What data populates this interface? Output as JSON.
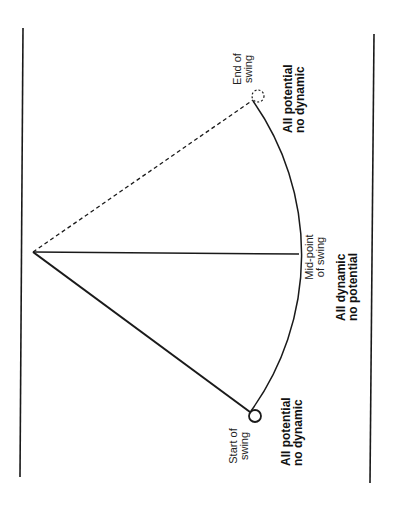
{
  "diagram": {
    "orientation": "rotated -90deg",
    "colors": {
      "background": "#ffffff",
      "ink": "#1a1a1a"
    },
    "geometry": {
      "pivot": [
        33,
        252
      ],
      "mid_point": [
        299,
        254
      ],
      "start_bob": [
        255,
        416
      ],
      "end_bob": [
        258,
        96
      ],
      "bob_radius": 6,
      "left_rule": {
        "x1": 23,
        "y1": 28,
        "x2": 20,
        "y2": 477
      },
      "right_rule": {
        "x1": 374,
        "y1": 34,
        "x2": 370,
        "y2": 483
      }
    },
    "labels": {
      "end_of_swing": {
        "line1": "End of",
        "line2": "swing"
      },
      "end_energy": {
        "line1": "All potential",
        "line2": "no dynamic"
      },
      "mid_point": {
        "line1": "Mid-point",
        "line2": "of swing"
      },
      "mid_energy": {
        "line1": "All dynamic",
        "line2": "no potential"
      },
      "start_of_swing": {
        "line1": "Start of",
        "line2": "swing"
      },
      "start_energy": {
        "line1": "All potential",
        "line2": "no dynamic"
      }
    }
  }
}
